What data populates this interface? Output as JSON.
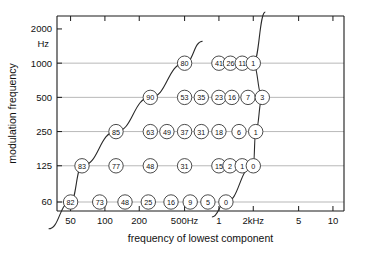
{
  "chart_data": {
    "type": "scatter",
    "title": "",
    "xlabel": "frequency of lowest component",
    "ylabel": "modulation frequency",
    "y_unit_label": "Hz",
    "xtick_labels": [
      "50",
      "100",
      "200",
      "500Hz",
      "1",
      "2kHz",
      "5",
      "10"
    ],
    "xtick_values": [
      50,
      100,
      200,
      500,
      1000,
      2000,
      5000,
      10000
    ],
    "ytick_labels": [
      "2000",
      "1000",
      "500",
      "250",
      "125",
      "60"
    ],
    "ytick_values": [
      2000,
      1000,
      500,
      250,
      125,
      60
    ],
    "xscale": "log",
    "yscale": "log",
    "xlim": [
      38,
      12500
    ],
    "ylim": [
      50,
      2600
    ],
    "grid": true,
    "legend": false,
    "annotations": [
      "left boundary diagonal line",
      "right boundary curve"
    ],
    "series": [
      {
        "name": "1000 Hz",
        "modulation_frequency": 1000,
        "points": [
          {
            "x": 500,
            "value": "80"
          },
          {
            "x": 1000,
            "value": "41"
          },
          {
            "x": 1260,
            "value": "26"
          },
          {
            "x": 1600,
            "value": "11"
          },
          {
            "x": 2000,
            "value": "1"
          }
        ]
      },
      {
        "name": "500 Hz",
        "modulation_frequency": 500,
        "points": [
          {
            "x": 250,
            "value": "90"
          },
          {
            "x": 500,
            "value": "53"
          },
          {
            "x": 700,
            "value": "35"
          },
          {
            "x": 1000,
            "value": "23"
          },
          {
            "x": 1300,
            "value": "16"
          },
          {
            "x": 1800,
            "value": "7"
          },
          {
            "x": 2400,
            "value": "3"
          }
        ]
      },
      {
        "name": "250 Hz",
        "modulation_frequency": 250,
        "points": [
          {
            "x": 125,
            "value": "85"
          },
          {
            "x": 250,
            "value": "63"
          },
          {
            "x": 350,
            "value": "49"
          },
          {
            "x": 500,
            "value": "37"
          },
          {
            "x": 700,
            "value": "31"
          },
          {
            "x": 1000,
            "value": "18"
          },
          {
            "x": 1500,
            "value": "6"
          },
          {
            "x": 2100,
            "value": "1"
          }
        ]
      },
      {
        "name": "125 Hz",
        "modulation_frequency": 125,
        "points": [
          {
            "x": 63,
            "value": "83"
          },
          {
            "x": 125,
            "value": "77"
          },
          {
            "x": 250,
            "value": "48"
          },
          {
            "x": 500,
            "value": "31"
          },
          {
            "x": 1000,
            "value": "15"
          },
          {
            "x": 1250,
            "value": "2"
          },
          {
            "x": 1600,
            "value": "1"
          },
          {
            "x": 2000,
            "value": "0"
          }
        ]
      },
      {
        "name": "60 Hz",
        "modulation_frequency": 60,
        "points": [
          {
            "x": 50,
            "value": "82"
          },
          {
            "x": 90,
            "value": "73"
          },
          {
            "x": 150,
            "value": "48"
          },
          {
            "x": 240,
            "value": "25"
          },
          {
            "x": 380,
            "value": "16"
          },
          {
            "x": 560,
            "value": "9"
          },
          {
            "x": 800,
            "value": "5"
          },
          {
            "x": 1150,
            "value": "0"
          }
        ]
      }
    ]
  },
  "colors": {
    "frame": "#1a1a1a",
    "grid": "#9a9a9a",
    "curve": "#2a2a2a",
    "bubble_fill": "#ffffff",
    "background": "#ffffff"
  }
}
